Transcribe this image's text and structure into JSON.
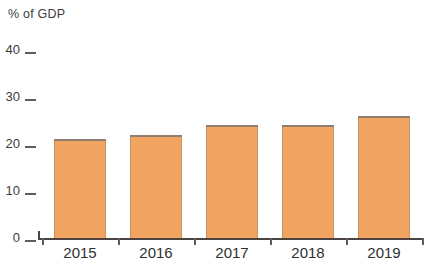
{
  "chart_data": {
    "type": "bar",
    "title": "",
    "subtitle": "",
    "xlabel": "",
    "ylabel": "% of GDP",
    "categories": [
      "2015",
      "2016",
      "2017",
      "2018",
      "2019"
    ],
    "values": [
      21,
      22,
      24,
      24,
      26
    ],
    "series": [
      {
        "name": "% of GDP",
        "values": [
          21,
          22,
          24,
          24,
          26
        ]
      }
    ],
    "ylim": [
      0,
      40
    ],
    "ytick_labels": [
      "0",
      "10",
      "20",
      "30",
      "40"
    ],
    "ytick_values": [
      0,
      10,
      20,
      30,
      40
    ],
    "grid": false,
    "legend": false,
    "legend_position": "none",
    "bar_color": "#F3A35E",
    "axis_color": "#4A4340",
    "text_color": "#3C3C3C",
    "background": "#FFFFFF",
    "annotations": []
  },
  "axis": {
    "y_title": "% of GDP",
    "ticks": [
      {
        "label": "40",
        "value": 40
      },
      {
        "label": "30",
        "value": 30
      },
      {
        "label": "20",
        "value": 20
      },
      {
        "label": "10",
        "value": 10
      },
      {
        "label": "0",
        "value": 0
      }
    ]
  },
  "bars": [
    {
      "label": "2015",
      "value": 21
    },
    {
      "label": "2016",
      "value": 22
    },
    {
      "label": "2017",
      "value": 24
    },
    {
      "label": "2018",
      "value": 24
    },
    {
      "label": "2019",
      "value": 26
    }
  ]
}
